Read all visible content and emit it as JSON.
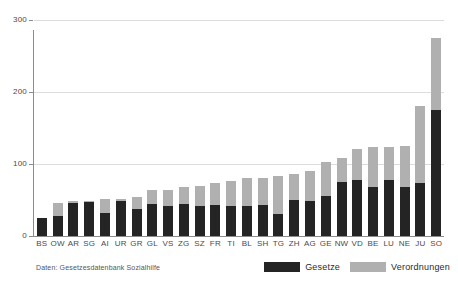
{
  "chart_data": {
    "type": "bar",
    "stacked": true,
    "title": "",
    "subtitle": "",
    "xlabel": "",
    "ylabel": "",
    "ylim": [
      0,
      300
    ],
    "yticks": [
      0,
      100,
      200,
      300
    ],
    "grid": true,
    "legend_position": "bottom-right",
    "categories": [
      "BS",
      "OW",
      "AR",
      "SG",
      "AI",
      "UR",
      "GR",
      "GL",
      "VS",
      "ZG",
      "SZ",
      "FR",
      "TI",
      "BL",
      "SH",
      "TG",
      "ZH",
      "AG",
      "GE",
      "NW",
      "VD",
      "BE",
      "LU",
      "NE",
      "JU",
      "SO"
    ],
    "series": [
      {
        "name": "Gesetze",
        "color": "#242424",
        "values": [
          25,
          28,
          46,
          47,
          32,
          49,
          38,
          44,
          42,
          45,
          41,
          43,
          41,
          42,
          43,
          30,
          50,
          49,
          56,
          75,
          78,
          68,
          78,
          68,
          73,
          175
        ]
      },
      {
        "name": "Verordnungen",
        "color": "#b0b0b0",
        "values": [
          0,
          18,
          2,
          1,
          19,
          2,
          16,
          20,
          22,
          23,
          29,
          31,
          35,
          38,
          38,
          54,
          36,
          41,
          47,
          34,
          43,
          56,
          46,
          57,
          107,
          100
        ]
      }
    ],
    "totals": [
      25,
      46,
      48,
      48,
      51,
      51,
      54,
      64,
      64,
      68,
      70,
      74,
      76,
      80,
      81,
      84,
      86,
      90,
      103,
      109,
      121,
      124,
      124,
      125,
      180,
      275
    ]
  },
  "axis": {
    "y_tick_labels": [
      "0",
      "100",
      "200",
      "300"
    ]
  },
  "legend": {
    "items": [
      {
        "label": "Gesetze",
        "color": "#242424",
        "key": "gesetze"
      },
      {
        "label": "Verordnungen",
        "color": "#b0b0b0",
        "key": "verordnungen"
      }
    ]
  },
  "footer": {
    "source_note": "Daten: Gesetzesdatenbank Sozialhilfe"
  }
}
